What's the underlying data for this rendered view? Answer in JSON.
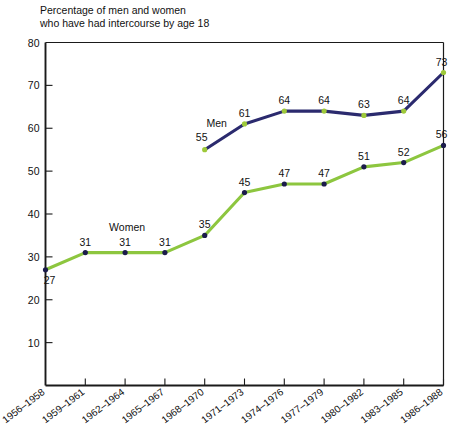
{
  "chart_data": {
    "type": "line",
    "title": "Percentage of men and women who have had intercourse by age 18",
    "title_lines": [
      "Percentage of men and women",
      "who have had intercourse by age 18"
    ],
    "xlabel": "",
    "ylabel": "",
    "ylim": [
      0,
      80
    ],
    "yticks": [
      10,
      20,
      30,
      40,
      50,
      60,
      70,
      80
    ],
    "ytick_labels": [
      "10",
      "20",
      "30",
      "40",
      "50",
      "60",
      "70",
      "80"
    ],
    "grid": false,
    "legend_position": "inline-annotation",
    "categories": [
      "1956–1958",
      "1959–1961",
      "1962–1964",
      "1965–1967",
      "1968–1970",
      "1971–1973",
      "1974–1976",
      "1977–1979",
      "1980–1982",
      "1983–1985",
      "1986–1988"
    ],
    "series": [
      {
        "name": "Men",
        "color": "#2b2a6e",
        "marker_color": "#9ec93a",
        "start_index": 4,
        "values": [
          null,
          null,
          null,
          null,
          55,
          61,
          64,
          64,
          63,
          64,
          73
        ],
        "labels": [
          "",
          "",
          "",
          "",
          "55",
          "61",
          "64",
          "64",
          "63",
          "64",
          "73"
        ],
        "label_positions": [
          "",
          "",
          "",
          "",
          "below-left",
          "above",
          "above",
          "above",
          "above",
          "above",
          "above"
        ]
      },
      {
        "name": "Women",
        "color": "#8dc63f",
        "marker_color": "#1b1b4b",
        "start_index": 0,
        "values": [
          27,
          31,
          31,
          31,
          35,
          45,
          47,
          47,
          51,
          52,
          56
        ],
        "labels": [
          "27",
          "31",
          "31",
          "31",
          "35",
          "45",
          "47",
          "47",
          "51",
          "52",
          "56"
        ],
        "label_positions": [
          "below-right",
          "above",
          "above",
          "above",
          "above",
          "above",
          "above",
          "above",
          "above",
          "above",
          "above"
        ]
      }
    ],
    "annotations": [
      {
        "text": "Men",
        "series": "Men"
      },
      {
        "text": "Women",
        "series": "Women"
      }
    ]
  }
}
